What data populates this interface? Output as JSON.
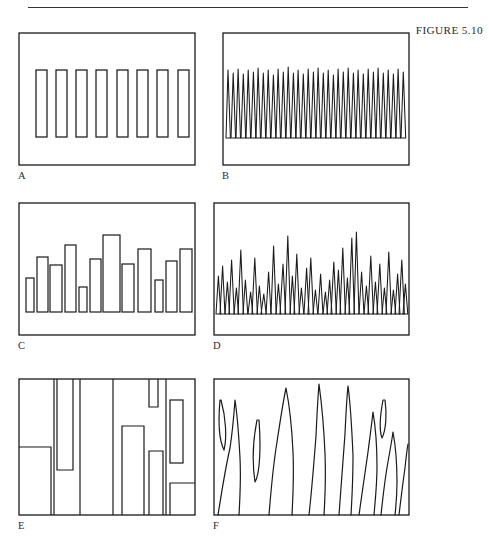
{
  "page": {
    "running_head": "",
    "figure_label": "FIGURE 5.10",
    "background_color": "#ffffff",
    "ink_color": "#1a1a1a"
  },
  "figure": {
    "label": "FIGURE 5.10",
    "panel_count": 6,
    "columns": 2,
    "rows": 3,
    "panels": [
      {
        "letter": "A",
        "style": "rectangles",
        "description": "eight identical evenly spaced upright rectangles of uniform width and height",
        "element_count": 8,
        "uniform": true,
        "baseline_fraction": 0.8,
        "top_fraction": 0.28,
        "element_width_fraction": 0.052,
        "gap_fraction": 0.058
      },
      {
        "letter": "B",
        "style": "blades",
        "description": "dense row of narrow pointed leaf blades, all the same height",
        "element_count": 36,
        "uniform": true,
        "baseline_fraction": 0.8,
        "top_fraction": 0.28,
        "element_width_fraction": 0.02
      },
      {
        "letter": "C",
        "style": "rectangles",
        "description": "row of upright rectangles of varying heights on a common baseline",
        "element_count": 14,
        "uniform": false,
        "baseline_fraction": 0.82,
        "heights": [
          0.26,
          0.46,
          0.38,
          0.58,
          0.18,
          0.44,
          0.68,
          0.36,
          0.55,
          0.24,
          0.42,
          0.55,
          0.3,
          0.52
        ],
        "widths": [
          0.042,
          0.055,
          0.06,
          0.055,
          0.04,
          0.052,
          0.085,
          0.058,
          0.062,
          0.042,
          0.052,
          0.058,
          0.032,
          0.03
        ]
      },
      {
        "letter": "D",
        "style": "blades",
        "description": "dense row of pointed leaf blades of varying heights on a common baseline",
        "element_count": 46,
        "uniform": false,
        "baseline_fraction": 0.84,
        "height_range": [
          0.16,
          0.72
        ]
      },
      {
        "letter": "E",
        "style": "rectangles",
        "description": "large rectangles of varied width and height, some hanging from the top edge and some rising from the bottom edge, forming a blocky vertical pattern",
        "element_count": 12,
        "uniform": false
      },
      {
        "letter": "F",
        "style": "blades",
        "description": "broad tall curving leaf blades of varied width spanning the panel, plus a few small closed leaf outlines",
        "element_count": 12,
        "uniform": false
      }
    ]
  }
}
